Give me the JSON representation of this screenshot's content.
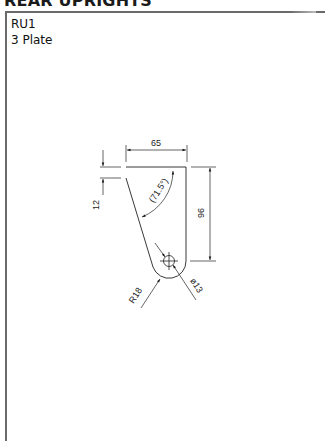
{
  "header": {
    "title": "REAR UPRIGHTS"
  },
  "part": {
    "id": "RU1",
    "name": "3 Plate"
  },
  "drawing": {
    "dimensions": {
      "width": "65",
      "height": "96",
      "offset": "12",
      "angle": "(71.5°)",
      "radius": "R18",
      "hole_diameter": "ø13"
    },
    "colors": {
      "line": "#222222",
      "frame": "#6a6a6a"
    }
  }
}
